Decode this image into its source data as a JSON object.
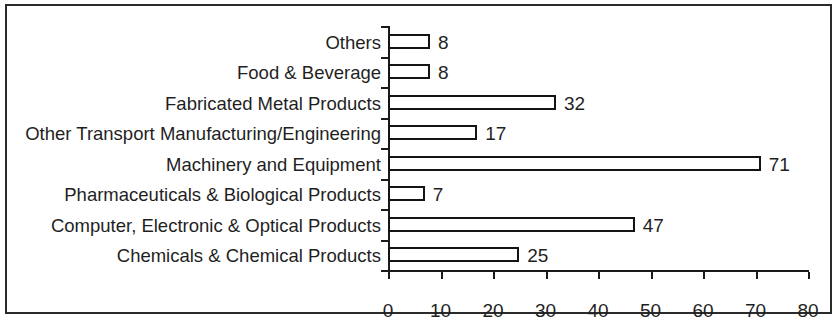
{
  "chart_data": {
    "type": "bar",
    "orientation": "horizontal",
    "title": "",
    "subtitle": "",
    "xlabel": "",
    "ylabel": "",
    "xlim": [
      0,
      80
    ],
    "xticks": [
      0,
      10,
      20,
      30,
      40,
      50,
      60,
      70,
      80
    ],
    "xtick_labels": [
      "0",
      "10",
      "20",
      "30",
      "40",
      "50",
      "60",
      "70",
      "80"
    ],
    "grid": false,
    "legend": false,
    "legend_position": "none",
    "bar_fill_color": "#ffffff",
    "bar_edge_color": "#141414",
    "axis_color": "#1a1a1a",
    "frame_color": "#2b2b2b",
    "categories": [
      "Others",
      "Food & Beverage",
      "Fabricated Metal Products",
      "Other Transport Manufacturing/Engineering",
      "Machinery and Equipment",
      "Pharmaceuticals & Biological Products",
      "Computer, Electronic & Optical Products",
      "Chemicals & Chemical Products"
    ],
    "values": [
      8,
      8,
      32,
      17,
      71,
      7,
      47,
      25
    ],
    "value_labels": [
      "8",
      "8",
      "32",
      "17",
      "71",
      "7",
      "47",
      "25"
    ]
  }
}
